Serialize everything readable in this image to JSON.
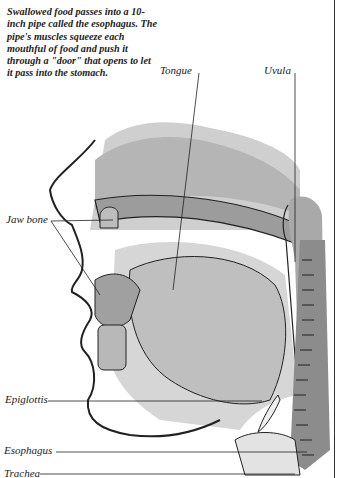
{
  "caption": "Swallowed food passes into a 10-inch pipe called the esophagus. The pipe's muscles squeeze each mouthful of food and push it through a \"door\" that opens to let it pass into the stomach.",
  "labels": {
    "tongue": "Tongue",
    "uvula": "Uvula",
    "jaw_bone": "Jaw bone",
    "epiglottis": "Epiglottis",
    "esophagus": "Esophagus",
    "trachea": "Trachea"
  },
  "colors": {
    "ink": "#222222",
    "tissue_light": "#c8c8c8",
    "tissue_mid": "#a8a8a8",
    "tissue_dark": "#8a8a8a"
  }
}
